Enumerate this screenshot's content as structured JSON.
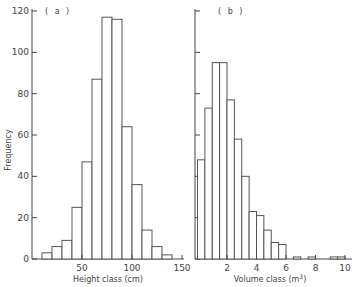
{
  "chart_data": [
    {
      "type": "bar",
      "panel": "(a)",
      "title": "",
      "xlabel": "Height class (cm)",
      "ylabel": "Frequency",
      "bin_width": 10,
      "bin_start": 10,
      "categories": [
        "10-20",
        "20-30",
        "30-40",
        "40-50",
        "50-60",
        "60-70",
        "70-80",
        "80-90",
        "90-100",
        "100-110",
        "110-120",
        "120-130",
        "130-140"
      ],
      "values": [
        3,
        6,
        9,
        25,
        47,
        87,
        117,
        116,
        64,
        36,
        14,
        6,
        2
      ],
      "xticks": [
        50,
        100,
        150
      ],
      "yticks": [
        0,
        20,
        40,
        60,
        80,
        100,
        120
      ],
      "xlim": [
        0,
        150
      ],
      "ylim": [
        0,
        120
      ],
      "grid": false
    },
    {
      "type": "bar",
      "panel": "(b)",
      "title": "",
      "xlabel": "Volume class (m³)",
      "ylabel": "Frequency",
      "bin_width": 0.5,
      "bin_start": 0,
      "categories": [
        "0-0.5",
        "0.5-1",
        "1-1.5",
        "1.5-2",
        "2-2.5",
        "2.5-3",
        "3-3.5",
        "3.5-4",
        "4-4.5",
        "4.5-5",
        "5-5.5",
        "5.5-6",
        "6-6.5",
        "6.5-7",
        "7-7.5",
        "7.5-8",
        "8-8.5",
        "8.5-9",
        "9-9.5",
        "9.5-10"
      ],
      "values": [
        48,
        73,
        95,
        95,
        77,
        58,
        40,
        23,
        21,
        14,
        8,
        7,
        0,
        1,
        0,
        1,
        0,
        0,
        1,
        1
      ],
      "xticks": [
        2,
        4,
        6,
        8,
        10
      ],
      "yticks": [
        0,
        20,
        40,
        60,
        80,
        100,
        120
      ],
      "xlim": [
        0,
        10.5
      ],
      "ylim": [
        0,
        120
      ],
      "grid": false
    }
  ],
  "labels": {
    "panel_a": "( a )",
    "panel_b": "( b )",
    "ylabel": "Frequency",
    "xlabel_a": "Height class (cm)",
    "xlabel_b_main": "Volume class (m",
    "xlabel_b_sup": "3",
    "xlabel_b_end": ")"
  }
}
